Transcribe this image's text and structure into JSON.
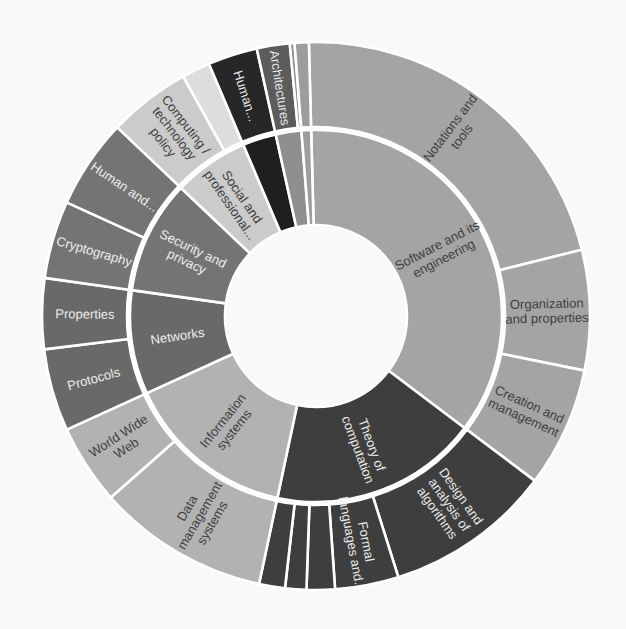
{
  "figure": {
    "title": "",
    "background_color": "#faf9f7",
    "divider_color": "#ffffff"
  },
  "chart_data": {
    "type": "sunburst",
    "title": "",
    "legend": "none",
    "rings": 2,
    "angle_convention": "degrees clockwise from 12 o'clock",
    "center": [
      316,
      316
    ],
    "radii": {
      "hole": 91,
      "ring1_outer": 186,
      "ring2_inner": 189,
      "ring2_outer": 274
    },
    "label_radius": {
      "inner": 140,
      "outer": 231
    },
    "categories": [
      {
        "label": "Software and its engineering",
        "label_lines": [
          "Software and its",
          "engineering"
        ],
        "start": -1.5,
        "end": 127,
        "color": "#a4a4a4",
        "text_color": "#3f3f3f",
        "children": [
          {
            "label": "Notations and tools",
            "label_lines": [
              "Notations and",
              "tools"
            ],
            "start": -1.5,
            "end": 76
          },
          {
            "label": "Organization and properties",
            "label_lines": [
              "Organization",
              "and properties"
            ],
            "start": 76,
            "end": 101.5
          },
          {
            "label": "Creation and management",
            "label_lines": [
              "Creation and",
              "management"
            ],
            "start": 101.5,
            "end": 127
          }
        ]
      },
      {
        "label": "Theory of computation",
        "label_lines": [
          "Theory of",
          "computation"
        ],
        "start": 127,
        "end": 192,
        "color": "#3e3e3e",
        "text_color": "#eaeaea",
        "children": [
          {
            "label": "Design and analysis of algorithms",
            "label_lines": [
              "Design and",
              "analysis of",
              "algorithms"
            ],
            "start": 127,
            "end": 162.5
          },
          {
            "label": "Formal languages and...",
            "label_lines": [
              "Formal",
              "languages and..."
            ],
            "start": 162.5,
            "end": 176
          },
          {
            "label": "",
            "start": 176,
            "end": 182
          },
          {
            "label": "",
            "start": 182,
            "end": 186.5
          },
          {
            "label": "",
            "start": 186.5,
            "end": 192
          }
        ]
      },
      {
        "label": "Information systems",
        "label_lines": [
          "Information",
          "systems"
        ],
        "start": 192,
        "end": 245.5,
        "color": "#b2b2b2",
        "text_color": "#3f3f3f",
        "children": [
          {
            "label": "Data management systems",
            "label_lines": [
              "Data",
              "management",
              "systems"
            ],
            "start": 192,
            "end": 228.5
          },
          {
            "label": "World Wide Web",
            "label_lines": [
              "World Wide",
              "Web"
            ],
            "start": 228.5,
            "end": 245.5
          }
        ]
      },
      {
        "label": "Networks",
        "label_lines": [
          "Networks"
        ],
        "start": 245.5,
        "end": 278,
        "color": "#696969",
        "text_color": "#ececec",
        "children": [
          {
            "label": "Protocols",
            "label_lines": [
              "Protocols"
            ],
            "start": 245.5,
            "end": 263
          },
          {
            "label": "Properties",
            "label_lines": [
              "Properties"
            ],
            "start": 263,
            "end": 278
          }
        ]
      },
      {
        "label": "Security and privacy",
        "label_lines": [
          "Security and",
          "privacy"
        ],
        "start": 278,
        "end": 313.5,
        "color": "#747474",
        "text_color": "#ececec",
        "children": [
          {
            "label": "Cryptography",
            "label_lines": [
              "Cryptography"
            ],
            "start": 278,
            "end": 294.5
          },
          {
            "label": "Human and...",
            "label_lines": [
              "Human and..."
            ],
            "start": 294.5,
            "end": 313.5
          }
        ]
      },
      {
        "label": "Social and professional...",
        "label_lines": [
          "Social and",
          "professional..."
        ],
        "start": 313.5,
        "end": 337,
        "color": "#cbcbcb",
        "text_color": "#3f3f3f",
        "children": [
          {
            "label": "Computing / technology policy",
            "label_lines": [
              "Computing /",
              "technology",
              "policy"
            ],
            "start": 313.5,
            "end": 331
          },
          {
            "label": "",
            "start": 331,
            "end": 337,
            "color": "#dddddd"
          }
        ]
      },
      {
        "label": "",
        "start": 337,
        "end": 347.5,
        "color": "#1f1f1f",
        "text_color": "#e6e6e6",
        "children": [
          {
            "label": "Human...",
            "label_lines": [
              "Human..."
            ],
            "start": 337,
            "end": 347.5,
            "color": "#272727"
          }
        ]
      },
      {
        "label": "",
        "start": 347.5,
        "end": 355.5,
        "color": "#8f8f8f",
        "text_color": "#e6e6e6",
        "children": [
          {
            "label": "Architectures",
            "label_lines": [
              "Architectures"
            ],
            "start": 347.5,
            "end": 354.5,
            "color": "#5c5c5c"
          },
          {
            "label": "",
            "start": 354.5,
            "end": 355.5
          }
        ]
      },
      {
        "label": "",
        "start": 355.5,
        "end": 358.5,
        "color": "#9d9d9d",
        "text_color": "#3f3f3f",
        "children": [
          {
            "label": "",
            "start": 355.5,
            "end": 358.5
          }
        ]
      }
    ]
  }
}
